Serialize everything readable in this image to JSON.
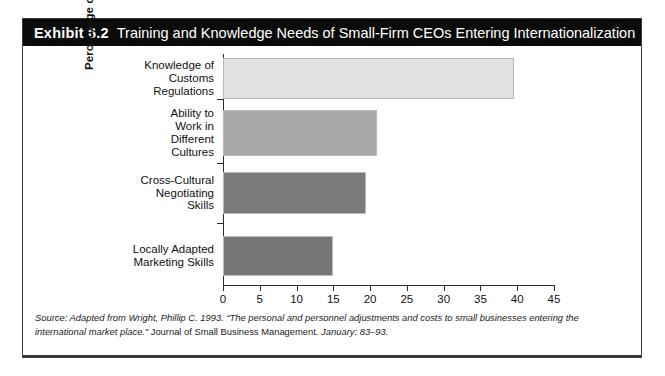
{
  "exhibit": {
    "label": "Exhibit 6.2",
    "title": "Training and Knowledge Needs of Small-Firm CEOs Entering Internationalization"
  },
  "source": {
    "lead": "Source: Adapted from Wright, Phillip C. 1993. “The personal and personnel adjustments and costs to small businesses entering the international market place.” ",
    "journal": "Journal of Small Business Management",
    "tail": ". January: 83–93."
  },
  "chart_data": {
    "type": "bar",
    "orientation": "horizontal",
    "title": "Training and Knowledge Needs of Small-Firm CEOs Entering Internationalization",
    "xlabel": "",
    "ylabel": "Percentage of CEOs Identifying Needs for:",
    "xlim": [
      0,
      45
    ],
    "xticks": [
      0,
      5,
      10,
      15,
      20,
      25,
      30,
      35,
      40,
      45
    ],
    "grid": false,
    "legend": "none",
    "categories": [
      "Knowledge of Customs Regulations",
      "Ability to Work in Different Cultures",
      "Cross-Cultural Negotiating Skills",
      "Locally Adapted Marketing Skills"
    ],
    "category_lines": [
      [
        "Knowledge of",
        "Customs",
        "Regulations"
      ],
      [
        "Ability to",
        "Work in",
        "Different",
        "Cultures"
      ],
      [
        "Cross-Cultural",
        "Negotiating",
        "Skills"
      ],
      [
        "Locally Adapted",
        "Marketing Skills"
      ]
    ],
    "values": [
      39.5,
      21,
      19.5,
      15
    ],
    "bar_colors": [
      "#e2e2e2",
      "#a9a9a9",
      "#7c7c7c",
      "#767676"
    ]
  },
  "colors": {
    "title_bar": "#0b0b0b",
    "title_text": "#ffffff",
    "frame": "#3a3a3a",
    "axis": "#2b2b2b"
  }
}
